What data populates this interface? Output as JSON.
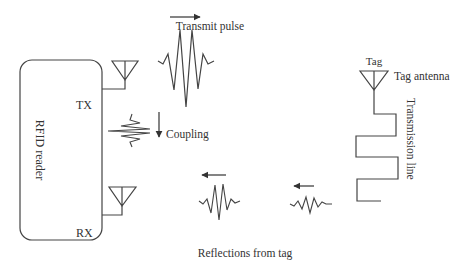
{
  "diagram": {
    "reader": {
      "label": "RFID reader",
      "tx_label": "TX",
      "rx_label": "RX"
    },
    "transmit_pulse": {
      "label": "Transmit pulse",
      "direction": "right"
    },
    "coupling": {
      "label": "Coupling",
      "direction": "down"
    },
    "tag": {
      "label": "Tag",
      "antenna_label": "Tag antenna",
      "line_label": "Transmission line"
    },
    "reflections": {
      "label": "Reflections from tag",
      "direction": "left"
    },
    "colors": {
      "stroke": "#444444",
      "text": "#333333",
      "background": "#ffffff"
    }
  }
}
